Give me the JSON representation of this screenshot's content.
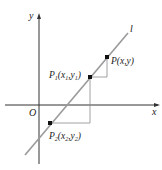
{
  "diagram": {
    "axes": {
      "x_label": "x",
      "y_label": "y",
      "origin_label": "O"
    },
    "line": {
      "label": "l"
    },
    "points": [
      {
        "id": "P",
        "label": "P",
        "coords_text": "(x,y)"
      },
      {
        "id": "P1",
        "label": "P",
        "subscript": "1",
        "coords_text_parts": [
          "(x",
          "1",
          ",y",
          "1",
          ")"
        ]
      },
      {
        "id": "P2",
        "label": "P",
        "subscript": "2",
        "coords_text_parts": [
          "(x",
          "2",
          ",y",
          "2",
          ")"
        ]
      }
    ],
    "colors": {
      "axis": "#333333",
      "line": "#9a9a9a",
      "guide": "#8a8a8a",
      "point": "#111111"
    }
  }
}
